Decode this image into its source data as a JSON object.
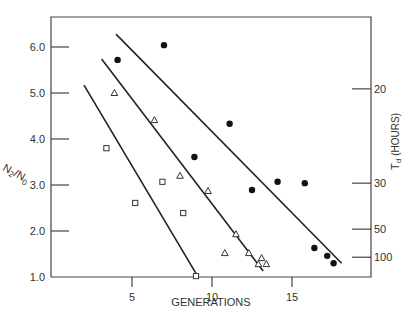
{
  "chart_data": {
    "type": "scatter",
    "title": "",
    "xlabel": "GENERATIONS",
    "ylabel": "N2/N0",
    "ylabel_right": "Td (HOURS)",
    "xlim": [
      0,
      20
    ],
    "ylim": [
      1.0,
      6.6
    ],
    "grid": false,
    "legend": null,
    "x_ticks": [
      5,
      10,
      15
    ],
    "y_ticks": [
      1.0,
      2.0,
      3.0,
      4.0,
      5.0,
      6.0
    ],
    "y_tick_labels": [
      "1.0",
      "2.0",
      "3.0",
      "4.0",
      "5.0",
      "6.0"
    ],
    "right_ticks": [
      {
        "label": "20",
        "y": 5.09
      },
      {
        "label": "30",
        "y": 3.04
      },
      {
        "label": "50",
        "y": 2.04
      },
      {
        "label": "100",
        "y": 1.43
      }
    ],
    "series": [
      {
        "name": "filled circles",
        "marker": "circle-filled",
        "points": [
          [
            4.1,
            5.72
          ],
          [
            7.0,
            6.04
          ],
          [
            8.9,
            3.61
          ],
          [
            11.1,
            4.33
          ],
          [
            12.5,
            2.89
          ],
          [
            14.1,
            3.07
          ],
          [
            15.8,
            3.04
          ],
          [
            16.4,
            1.63
          ],
          [
            17.2,
            1.46
          ],
          [
            17.6,
            1.3
          ]
        ],
        "fit_line": [
          [
            4.0,
            6.28
          ],
          [
            18.1,
            1.3
          ]
        ]
      },
      {
        "name": "open triangles",
        "marker": "triangle-open",
        "points": [
          [
            3.9,
            5.0
          ],
          [
            6.4,
            4.41
          ],
          [
            8.0,
            3.2
          ],
          [
            9.75,
            2.87
          ],
          [
            11.5,
            1.93
          ],
          [
            10.8,
            1.52
          ],
          [
            12.3,
            1.52
          ],
          [
            13.1,
            1.41
          ],
          [
            12.9,
            1.28
          ],
          [
            13.4,
            1.28
          ]
        ],
        "fit_line": [
          [
            3.1,
            5.74
          ],
          [
            13.2,
            1.13
          ]
        ]
      },
      {
        "name": "open squares",
        "marker": "square-open",
        "points": [
          [
            3.4,
            3.8
          ],
          [
            5.2,
            2.61
          ],
          [
            6.9,
            3.07
          ],
          [
            8.2,
            2.39
          ],
          [
            9.0,
            1.02
          ]
        ],
        "fit_line": [
          [
            2.0,
            5.17
          ],
          [
            9.1,
            1.02
          ]
        ]
      }
    ]
  },
  "labels": {
    "x_axis_title": "GENERATIONS",
    "y_axis_title_main": "N",
    "y_axis_title_sub1": "2",
    "y_axis_title_sub2": "0",
    "right_axis_title": "(HOURS)",
    "right_axis_title_T": "T",
    "right_axis_title_d": "d"
  }
}
